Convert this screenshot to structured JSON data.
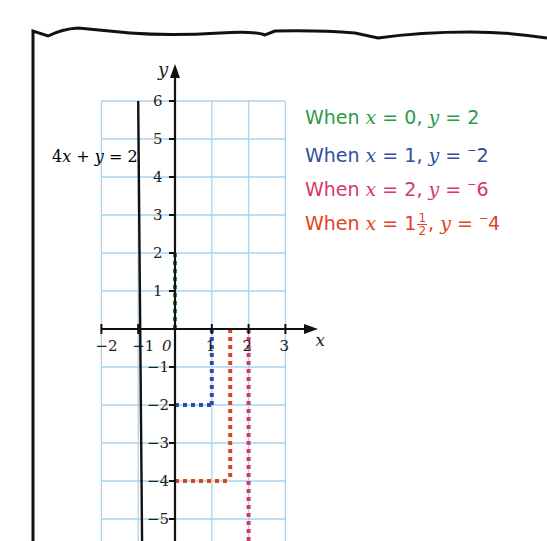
{
  "chart_data": {
    "type": "line",
    "title": "",
    "xlabel": "x",
    "ylabel": "y",
    "xlim": [
      -2,
      3
    ],
    "ylim": [
      -6,
      6
    ],
    "grid": true,
    "x_ticks": [
      "−2",
      "−1",
      "0",
      "1",
      "2",
      "3"
    ],
    "y_ticks": [
      "6",
      "5",
      "4",
      "3",
      "2",
      "1",
      "−1",
      "−2",
      "−3",
      "−4",
      "−5"
    ],
    "series": [
      {
        "name": "4x + y = 2",
        "equation": "y = 2 - 4x",
        "x": [
          -1,
          0,
          1,
          1.5,
          2
        ],
        "y": [
          6,
          2,
          -2,
          -4,
          -6
        ],
        "color": "#111111"
      }
    ],
    "guides": [
      {
        "x": 0,
        "y": 2,
        "color": "#2e9a48"
      },
      {
        "x": 1,
        "y": -2,
        "color": "#2f4fa0"
      },
      {
        "x": 2,
        "y": -6,
        "color": "#d43a66"
      },
      {
        "x": 1.5,
        "y": -4,
        "color": "#e0441f"
      }
    ],
    "annotations": [
      "When x = 0, y = 2",
      "When x = 1, y = −2",
      "When x = 2, y = −6",
      "When x = 1½, y = −4"
    ]
  },
  "line_label": {
    "a": "4",
    "x": "x",
    "plus": " + ",
    "y": "y",
    "eq": " = 2"
  },
  "statements": [
    {
      "when": "When ",
      "xvar": "x",
      "xeq": " = ",
      "xval": "0",
      "sep": ", ",
      "yvar": "y",
      "yeq": " = ",
      "ysign": "",
      "yval": "2",
      "color": "#2e9a48"
    },
    {
      "when": "When ",
      "xvar": "x",
      "xeq": " = ",
      "xval": "1",
      "sep": ", ",
      "yvar": "y",
      "yeq": " = ",
      "ysign": "−",
      "yval": "2",
      "color": "#2f4fa0"
    },
    {
      "when": "When ",
      "xvar": "x",
      "xeq": " = ",
      "xval": "2",
      "sep": ", ",
      "yvar": "y",
      "yeq": " = ",
      "ysign": "−",
      "yval": "6",
      "color": "#d43a66"
    },
    {
      "when": "When ",
      "xvar": "x",
      "xeq": " = ",
      "xval": "1",
      "frac_num": "1",
      "frac_den": "2",
      "sep": ", ",
      "yvar": "y",
      "yeq": " = ",
      "ysign": "−",
      "yval": "4",
      "color": "#e0441f"
    }
  ],
  "colors": {
    "grid": "#a9d4ef",
    "axis": "#111111",
    "frame": "#111111"
  }
}
